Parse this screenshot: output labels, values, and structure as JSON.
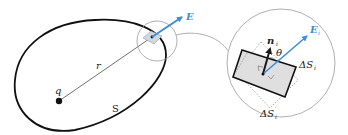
{
  "diagram": {
    "labels": {
      "charge": "q",
      "radius": "r",
      "surface": "S",
      "field": "E",
      "field_i": "E",
      "field_i_sub": "i",
      "normal": "n",
      "normal_sub": "i",
      "angle": "θ",
      "area_delta": "ΔS",
      "area_delta_sub": "i",
      "area_proj": "ΔS",
      "area_proj_prime": "′",
      "area_proj_sub": "i"
    },
    "colors": {
      "field_arrow": "#3b8ed8",
      "surface_stroke": "#111111",
      "element_fill": "#d9d9d9",
      "patch_fill": "#cfd8e0",
      "guide_circle": "#9a9a9a"
    }
  }
}
